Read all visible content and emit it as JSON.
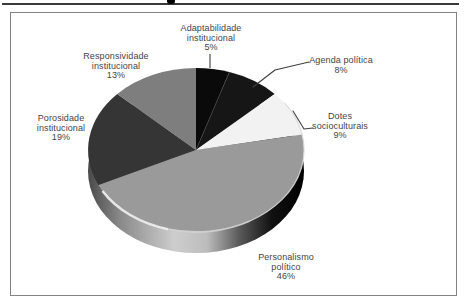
{
  "figure": {
    "frame_border_color": "#828282",
    "background_color": "#ffffff",
    "label_text_color": "#454545"
  },
  "chart_data": {
    "type": "pie",
    "style": "3d",
    "direction": "clockwise",
    "start_angle": "12-oclock",
    "values_unit": "%",
    "legend": "none (direct labels with leader lines)",
    "slices": [
      {
        "name": "adaptabilidade-institucional",
        "line1": "Adaptabilidade",
        "line2": "institucional",
        "pct": "5%",
        "value": 5,
        "color": "#0a0a0a"
      },
      {
        "name": "agenda-politica",
        "line1": "Agenda política",
        "line2": "",
        "pct": "8%",
        "value": 8,
        "color": "#161616"
      },
      {
        "name": "dotes-socioculturais",
        "line1": "Dotes",
        "line2": "socioculturais",
        "pct": "9%",
        "value": 9,
        "color": "#f2f2f2"
      },
      {
        "name": "personalismo-politico",
        "line1": "Personalismo",
        "line2": "político",
        "pct": "46%",
        "value": 46,
        "color": "#9a9a9a"
      },
      {
        "name": "porosidade-institucional",
        "line1": "Porosidade",
        "line2": "institucional",
        "pct": "19%",
        "value": 19,
        "color": "#353535"
      },
      {
        "name": "responsividade-institucional",
        "line1": "Responsividade",
        "line2": "institucional",
        "pct": "13%",
        "value": 13,
        "color": "#7e7e7e"
      }
    ]
  }
}
